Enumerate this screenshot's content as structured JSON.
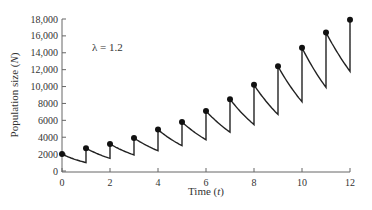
{
  "chart_data": {
    "type": "line",
    "title": "",
    "xlabel": "Time (t)",
    "ylabel": "Population size (N)",
    "xlim": [
      0,
      12
    ],
    "ylim": [
      0,
      18000
    ],
    "x_ticks": [
      "0",
      "2",
      "4",
      "6",
      "8",
      "10",
      "12"
    ],
    "y_ticks": [
      "0",
      "2000",
      "4000",
      "6000",
      "8000",
      "10,000",
      "12,000",
      "14,000",
      "16,000",
      "18,000"
    ],
    "grid": false,
    "legend": null,
    "annotations": [
      {
        "text": "λ = 1.2",
        "x": 2,
        "y": 14000
      }
    ],
    "series": [
      {
        "name": "Census points (birth pulses)",
        "marker": "filled-circle",
        "x": [
          0,
          1,
          2,
          3,
          4,
          5,
          6,
          7,
          8,
          9,
          10,
          11,
          12
        ],
        "values": [
          2000,
          2700,
          3200,
          3900,
          4900,
          5800,
          7100,
          8500,
          10200,
          12400,
          14600,
          16400,
          17900
        ]
      },
      {
        "name": "Between-pulse decline (troughs just before each pulse)",
        "marker": "none",
        "x": [
          1,
          2,
          3,
          4,
          5,
          6,
          7,
          8,
          9,
          10,
          11,
          12
        ],
        "values": [
          1000,
          1500,
          1900,
          2400,
          3000,
          3700,
          4600,
          5500,
          6700,
          8200,
          9900,
          11800
        ]
      }
    ]
  },
  "labels": {
    "xlabel_text": "Time (",
    "xlabel_var": "t",
    "xlabel_close": ")",
    "ylabel_text": "Population size (",
    "ylabel_var": "N",
    "ylabel_close": ")",
    "annotation": "λ = 1.2"
  }
}
